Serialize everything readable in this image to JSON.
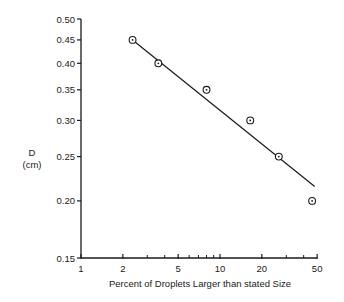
{
  "chart_data": {
    "type": "scatter",
    "title": "",
    "xlabel": "Percent of Droplets Larger than stated Size",
    "ylabel": "D",
    "ylabel_unit": "(cm)",
    "xscale": "log",
    "yscale": "log",
    "xlim": [
      1,
      50
    ],
    "ylim": [
      0.15,
      0.5
    ],
    "x_ticks": [
      1,
      2,
      5,
      10,
      20,
      50
    ],
    "x_tick_labels": [
      "1",
      "2",
      "5",
      "10",
      "20",
      "50"
    ],
    "x_minor_ticks": [
      3,
      4,
      6,
      7,
      8,
      9,
      30,
      40
    ],
    "y_ticks": [
      0.15,
      0.2,
      0.25,
      0.3,
      0.35,
      0.4,
      0.45,
      0.5
    ],
    "y_tick_labels": [
      "0.15",
      "0.20",
      "0.25",
      "0.30",
      "0.35",
      "0.40",
      "0.45",
      "0.50"
    ],
    "grid": false,
    "legend": null,
    "series": [
      {
        "name": "observed",
        "marker": "circle-dot",
        "points": [
          {
            "x": 2.35,
            "y": 0.45
          },
          {
            "x": 3.6,
            "y": 0.4
          },
          {
            "x": 8.0,
            "y": 0.35
          },
          {
            "x": 16.5,
            "y": 0.3
          },
          {
            "x": 26.5,
            "y": 0.25
          },
          {
            "x": 46,
            "y": 0.2
          }
        ]
      },
      {
        "name": "fit",
        "style": "line",
        "points": [
          {
            "x": 2.35,
            "y": 0.45
          },
          {
            "x": 48,
            "y": 0.215
          }
        ]
      }
    ]
  }
}
